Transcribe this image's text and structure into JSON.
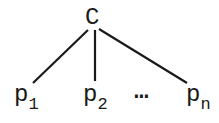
{
  "diagram": {
    "type": "tree",
    "root": {
      "label": "C"
    },
    "children": [
      {
        "label": "p",
        "subscript": "1"
      },
      {
        "label": "p",
        "subscript": "2"
      },
      {
        "label": "p",
        "subscript": "n"
      }
    ],
    "ellipsis": "⋯",
    "stroke_color": "#1a1a1a"
  }
}
